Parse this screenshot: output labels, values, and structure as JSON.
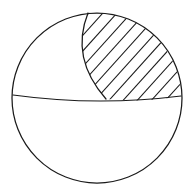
{
  "figure": {
    "type": "geometric-line-diagram",
    "style": "hand-drawn black line art on white background",
    "canvas": {
      "width": 193,
      "height": 196
    },
    "background_color": "#ffffff",
    "line_color": "#1a1a1a",
    "line_width": 1.25,
    "fill_color": "#ffffff"
  },
  "geometry": {
    "outer_circle": {
      "name": "sphere-outline",
      "center_x": 97,
      "center_y": 98,
      "radius": 85,
      "left_x": 12,
      "right_x": 182,
      "top_y": 13,
      "bottom_y": 183
    },
    "equator_chord": {
      "name": "equator-line",
      "description": "slightly downward-bowed chord spanning the circle, separating upper and lower halves",
      "start_x": 13,
      "start_y": 95,
      "end_x": 181,
      "end_y": 96,
      "mid_x": 97,
      "mid_y": 101,
      "sag": 5
    },
    "lens_arc": {
      "name": "meridian-arc",
      "description": "curve from the top apex of the circle bowing left and down to the equator line, forming the left boundary of the hatched wedge",
      "apex_x": 88,
      "apex_y": 13,
      "foot_x": 106,
      "foot_y": 99,
      "control_x": 70,
      "control_y": 58
    },
    "hatched_region": {
      "name": "hatched-wedge",
      "description": "region bounded left by the meridian arc, right by the circle arc, and below by the equator chord",
      "hatch_angle_degrees": 48,
      "hatch_spacing_px": 10.5,
      "hatch_line_count": 16,
      "hatch_direction": "lower-left to upper-right"
    }
  },
  "labels": {
    "visible_text": [],
    "note": "No text, axis ticks, legend, or annotations appear in this figure."
  }
}
